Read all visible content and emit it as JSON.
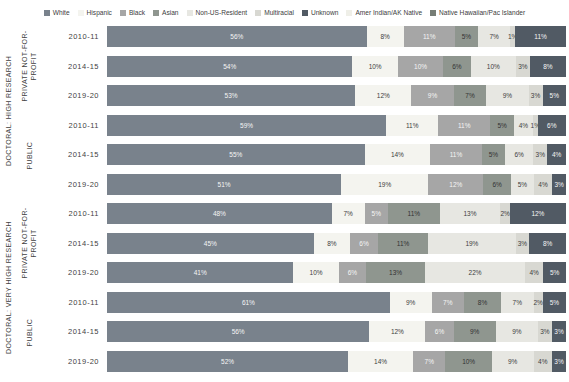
{
  "legend": [
    {
      "label": "White",
      "color": "#79828c",
      "text_color": "#f5f5f5"
    },
    {
      "label": "Hispanic",
      "color": "#f4f4ef",
      "text_color": "#404040"
    },
    {
      "label": "Black",
      "color": "#a6a6a6",
      "text_color": "#f5f5f5"
    },
    {
      "label": "Asian",
      "color": "#8f968f",
      "text_color": "#333333"
    },
    {
      "label": "Non-US-Resident",
      "color": "#e7e7e2",
      "text_color": "#404040"
    },
    {
      "label": "Multiracial",
      "color": "#d8d8d2",
      "text_color": "#404040"
    },
    {
      "label": "Unknown",
      "color": "#515a64",
      "text_color": "#f5f5f5"
    },
    {
      "label": "Amer Indian/AK Native",
      "color": "#efefe8",
      "text_color": "#404040"
    },
    {
      "label": "Native Hawaiian/Pac Islander",
      "color": "#767d76",
      "text_color": "#f5f5f5"
    }
  ],
  "chart_data": {
    "type": "bar",
    "stacked": true,
    "orientation": "horizontal",
    "unit": "%",
    "value_axis_range": [
      0,
      100
    ],
    "grid": false,
    "legend_position": "top",
    "categories": [
      "White",
      "Hispanic",
      "Black",
      "Asian",
      "Non-US-Resident",
      "Multiracial",
      "Unknown",
      "Amer Indian/AK Native",
      "Native Hawaiian/Pac Islander"
    ],
    "groups": [
      {
        "level": "DOCTORAL: HIGH RESEARCH",
        "subgroups": [
          {
            "control": "PRIVATE NOT-FOR-PROFIT",
            "rows": [
              {
                "year": "2010-11",
                "values": [
                  56,
                  8,
                  11,
                  5,
                  7,
                  1,
                  11,
                  0,
                  0
                ]
              },
              {
                "year": "2014-15",
                "values": [
                  54,
                  10,
                  10,
                  6,
                  10,
                  3,
                  8,
                  0,
                  0
                ]
              },
              {
                "year": "2019-20",
                "values": [
                  53,
                  12,
                  9,
                  7,
                  9,
                  3,
                  5,
                  0,
                  0
                ]
              }
            ]
          },
          {
            "control": "PUBLIC",
            "rows": [
              {
                "year": "2010-11",
                "values": [
                  59,
                  11,
                  11,
                  5,
                  4,
                  1,
                  6,
                  0,
                  0
                ]
              },
              {
                "year": "2014-15",
                "values": [
                  55,
                  14,
                  11,
                  5,
                  6,
                  3,
                  4,
                  0,
                  0
                ]
              },
              {
                "year": "2019-20",
                "values": [
                  51,
                  19,
                  12,
                  6,
                  5,
                  4,
                  3,
                  0,
                  0
                ]
              }
            ]
          }
        ]
      },
      {
        "level": "DOCTORAL: VERY HIGH RESEARCH",
        "subgroups": [
          {
            "control": "PRIVATE NOT-FOR-PROFIT",
            "rows": [
              {
                "year": "2010-11",
                "values": [
                  48,
                  7,
                  5,
                  11,
                  13,
                  2,
                  12,
                  0,
                  0
                ]
              },
              {
                "year": "2014-15",
                "values": [
                  45,
                  8,
                  6,
                  11,
                  19,
                  3,
                  8,
                  0,
                  0
                ]
              },
              {
                "year": "2019-20",
                "values": [
                  41,
                  10,
                  6,
                  13,
                  22,
                  4,
                  5,
                  0,
                  0
                ]
              }
            ]
          },
          {
            "control": "PUBLIC",
            "rows": [
              {
                "year": "2010-11",
                "values": [
                  61,
                  9,
                  7,
                  8,
                  7,
                  2,
                  5,
                  0,
                  0
                ]
              },
              {
                "year": "2014-15",
                "values": [
                  56,
                  12,
                  6,
                  9,
                  9,
                  3,
                  3,
                  0,
                  0
                ]
              },
              {
                "year": "2019-20",
                "values": [
                  52,
                  14,
                  7,
                  10,
                  9,
                  4,
                  3,
                  0,
                  0
                ]
              }
            ]
          }
        ]
      }
    ]
  }
}
